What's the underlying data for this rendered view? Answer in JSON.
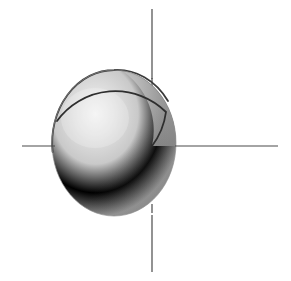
{
  "figure": {
    "canvas": {
      "width": 291,
      "height": 281
    },
    "background_color": "#ffffff"
  },
  "colors": {
    "background": "#ffffff",
    "axis_stroke": "#4a4a4a",
    "outline_stroke": "#3b3b3b",
    "arc_stroke": "#2e2e2e",
    "body_light": "#efefef",
    "body_mid": "#b9b9b9",
    "body_dark": "#8d8d8d",
    "body_shadow": "#7c7c7c",
    "crescent": "#9a9a9a"
  },
  "axes": {
    "origin": {
      "x": 152,
      "y": 146
    },
    "horizontal": {
      "label": "horizontal-axis",
      "y": 146,
      "x_start": 22,
      "x_end": 278,
      "solid_segments": [
        {
          "from": 22,
          "to": 54
        },
        {
          "from": 176,
          "to": 278
        }
      ],
      "dashed_segment": {
        "from": 54,
        "to": 176
      },
      "style": "solid-outside-dashed-inside",
      "stroke_width": 1.2
    },
    "vertical": {
      "label": "vertical-axis",
      "x": 152,
      "y_start": 9,
      "y_end": 272,
      "solid_segments": [
        {
          "from": 9,
          "to": 78
        },
        {
          "from": 216,
          "to": 272
        }
      ],
      "dashed_segment": {
        "from": 78,
        "to": 216
      },
      "style": "solid-outside-dashed-inside",
      "stroke_width": 1.2
    },
    "dash_pattern": {
      "dash": 9,
      "gap": 5
    }
  },
  "solid": {
    "name": "ellipsoid-body",
    "shape": "ellipse",
    "center": {
      "x": 114,
      "y": 143
    },
    "radius_x": 62,
    "radius_y": 73,
    "bounds": {
      "left": 52,
      "right": 176,
      "top": 70,
      "bottom": 216
    },
    "highlight": {
      "x": 95,
      "y": 118,
      "radius": 52
    },
    "outline": {
      "name": "upper-left-limb-outline",
      "visible_from_deg": 95,
      "visible_to_deg": 215,
      "stroke_width": 1.8
    }
  },
  "inner_sphere": {
    "name": "inner-sphere-arc",
    "description": "Dark arc of a second sphere intersecting the ellipsoid; begins at the upper-left limb, crosses the vertical axis to the right and terminates at the origin.",
    "center": {
      "x": 110,
      "y": 138
    },
    "radius": 72,
    "stroke_width": 1.8,
    "crescent_region": "right-of-axis"
  }
}
